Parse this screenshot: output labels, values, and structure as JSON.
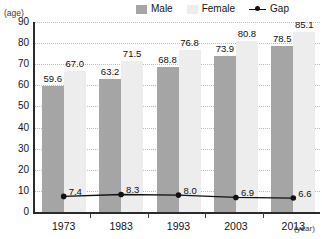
{
  "legend": {
    "entries": [
      {
        "label": "Male",
        "kind": "swatch",
        "color": "#a5a5a5"
      },
      {
        "label": "Female",
        "kind": "swatch",
        "color": "#ededed"
      },
      {
        "label": "Gap",
        "kind": "line",
        "color": "#111111"
      }
    ]
  },
  "axes": {
    "y_title": "(age)",
    "x_title": "(year)"
  },
  "chart_data": {
    "type": "bar",
    "title": "",
    "subtitle": "",
    "xlabel": "(year)",
    "ylabel": "(age)",
    "categories": [
      "1973",
      "1983",
      "1993",
      "2003",
      "2013"
    ],
    "ylim": [
      0,
      90
    ],
    "yticks": [
      "0",
      "10",
      "20",
      "30",
      "40",
      "50",
      "60",
      "70",
      "80",
      "90"
    ],
    "ytick_values": [
      0,
      10,
      20,
      30,
      40,
      50,
      60,
      70,
      80,
      90
    ],
    "grid": true,
    "grid_style": "dotted-horizontal",
    "legend_position": "top-right",
    "series": [
      {
        "name": "Male",
        "type": "bar",
        "color": "#a5a5a5",
        "values": [
          59.6,
          63.2,
          68.8,
          73.9,
          78.5
        ],
        "labels": [
          "59.6",
          "63.2",
          "68.8",
          "73.9",
          "78.5"
        ]
      },
      {
        "name": "Female",
        "type": "bar",
        "color": "#ededed",
        "values": [
          67.0,
          71.5,
          76.8,
          80.8,
          85.1
        ],
        "labels": [
          "67.0",
          "71.5",
          "76.8",
          "80.8",
          "85.1"
        ]
      },
      {
        "name": "Gap",
        "type": "line",
        "color": "#111111",
        "marker": "circle",
        "values": [
          7.4,
          8.3,
          8.0,
          6.9,
          6.6
        ],
        "labels": [
          "7.4",
          "8.3",
          "8.0",
          "6.9",
          "6.6"
        ]
      }
    ]
  }
}
